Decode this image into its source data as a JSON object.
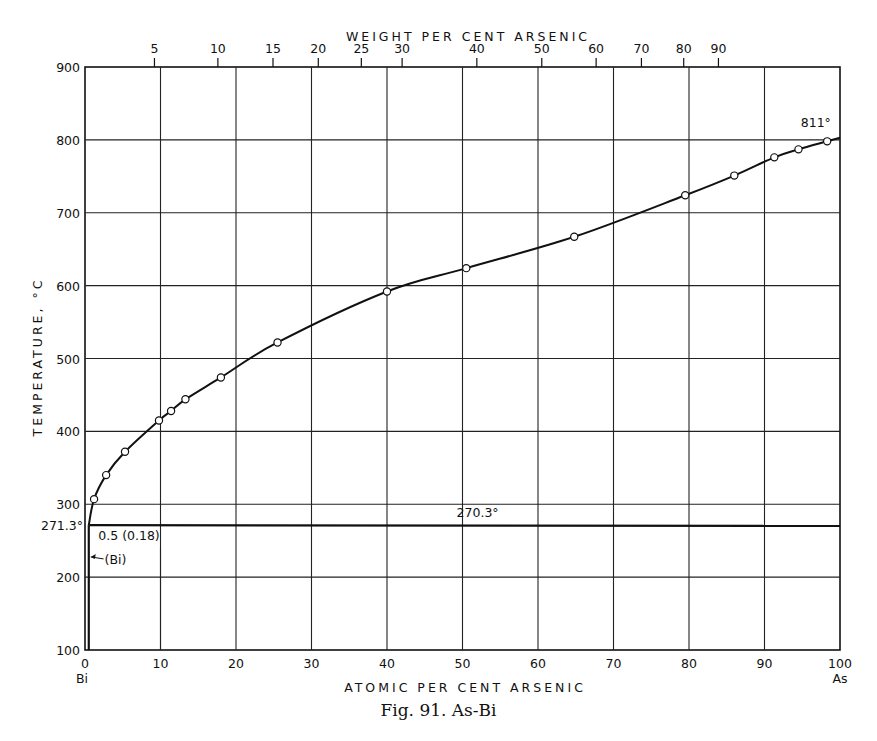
{
  "chart_data": {
    "type": "line",
    "title": "Fig. 91. As-Bi",
    "xlabel": "ATOMIC PER CENT ARSENIC",
    "x2label": "WEIGHT PER CENT ARSENIC",
    "ylabel": "TEMPERATURE, °C",
    "xlim": [
      0,
      100
    ],
    "ylim": [
      100,
      900
    ],
    "grid": true,
    "x_ticks": [
      0,
      10,
      20,
      30,
      40,
      50,
      60,
      70,
      80,
      90,
      100
    ],
    "y_ticks": [
      100,
      200,
      300,
      400,
      500,
      600,
      700,
      800,
      900
    ],
    "x_end_labels": {
      "left": "Bi",
      "right": "As"
    },
    "top_ticks": [
      {
        "label": "5",
        "at": 9.2
      },
      {
        "label": "10",
        "at": 17.6
      },
      {
        "label": "15",
        "at": 24.9
      },
      {
        "label": "20",
        "at": 30.9
      },
      {
        "label": "25",
        "at": 36.6
      },
      {
        "label": "30",
        "at": 42.0
      },
      {
        "label": "40",
        "at": 51.9
      },
      {
        "label": "50",
        "at": 60.5
      },
      {
        "label": "60",
        "at": 67.7
      },
      {
        "label": "70",
        "at": 73.7
      },
      {
        "label": "80",
        "at": 79.3
      },
      {
        "label": "90",
        "at": 83.9
      }
    ],
    "series": [
      {
        "name": "Liquidus",
        "x": [
          0.5,
          1.2,
          2.8,
          5.3,
          9.8,
          11.4,
          13.3,
          18.0,
          25.5,
          40.0,
          50.5,
          64.8,
          79.5,
          86.0,
          91.3,
          94.5,
          98.3,
          100
        ],
        "y": [
          271.3,
          307,
          340,
          372,
          415,
          428,
          444,
          474,
          522,
          592,
          624,
          667,
          724,
          751,
          776,
          787,
          798,
          803
        ]
      },
      {
        "name": "Eutectic horizontal",
        "x": [
          0.5,
          100
        ],
        "y": [
          271.3,
          270.3
        ]
      },
      {
        "name": "(Bi) solidus",
        "x": [
          0.5,
          0.5
        ],
        "y": [
          100,
          271.3
        ]
      }
    ],
    "annotations": [
      {
        "text": "811°",
        "x": 96,
        "y": 815
      },
      {
        "text": "270.3°",
        "x": 52,
        "y": 280
      },
      {
        "text": "271.3°",
        "x": 0,
        "y": 271.3
      },
      {
        "text": "0.5 (0.18)",
        "x": 1.5,
        "y": 255
      },
      {
        "text": "(Bi)",
        "x": 1,
        "y": 225
      }
    ]
  }
}
